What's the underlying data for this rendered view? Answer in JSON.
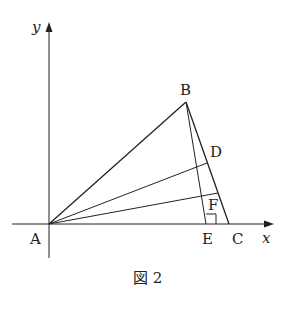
{
  "figure": {
    "caption": "図 2",
    "axes": {
      "x_label": "x",
      "y_label": "y"
    },
    "points": {
      "A": {
        "label": "A"
      },
      "B": {
        "label": "B"
      },
      "C": {
        "label": "C"
      },
      "D": {
        "label": "D"
      },
      "E": {
        "label": "E"
      },
      "F": {
        "label": "F"
      }
    },
    "segments": [
      "AB",
      "AD",
      "AF",
      "BC",
      "BE",
      "DE"
    ],
    "right_angle_at": "E",
    "colors": {
      "stroke": "#222222",
      "background": "#ffffff"
    }
  }
}
